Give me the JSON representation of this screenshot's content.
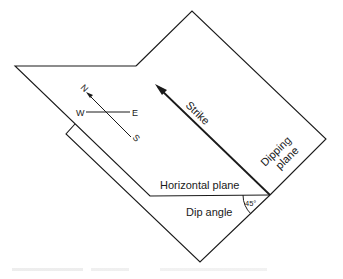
{
  "diagram": {
    "type": "geologic-strike-dip",
    "labels": {
      "strike": "Strike",
      "dipping_plane_line1": "Dipping",
      "dipping_plane_line2": "plane",
      "horizontal_plane": "Horizontal plane",
      "dip_angle": "Dip angle",
      "angle_value": "45°"
    },
    "compass": {
      "north": "N",
      "south": "S",
      "east": "E",
      "west": "W"
    },
    "colors": {
      "line": "#1a1a1a",
      "background": "#ffffff"
    }
  }
}
